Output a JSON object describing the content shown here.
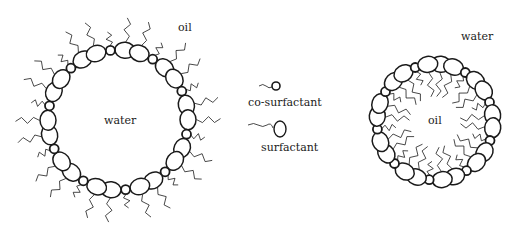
{
  "diagram": {
    "colors": {
      "stroke": "#1a1a1a",
      "background": "#ffffff"
    },
    "left_micelle": {
      "type": "oil-in-water? no — water-in-oil (reverse)",
      "inner_label": "water",
      "outer_label": "oil",
      "center": [
        118,
        120
      ],
      "radius": 70,
      "surfactants": 20,
      "cosurfactants": 10,
      "tails": "outward"
    },
    "right_micelle": {
      "inner_label": "oil",
      "outer_label": "water",
      "center": [
        435,
        122
      ],
      "radius": 58,
      "surfactants": 19,
      "cosurfactants": 9,
      "tails": "inward"
    },
    "legend": {
      "cosurfactant_label": "co-surfactant",
      "surfactant_label": "surfactant"
    }
  }
}
